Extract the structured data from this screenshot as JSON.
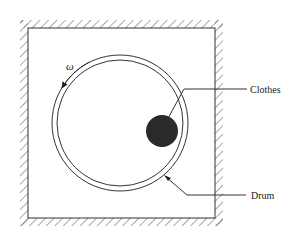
{
  "diagram": {
    "type": "physical-schematic",
    "labels": {
      "omega": "ω",
      "clothes": "Clothes",
      "drum": "Drum"
    },
    "colors": {
      "line": "#333333",
      "clothes_fill": "#2a2a2a",
      "background": "#ffffff"
    },
    "elements": [
      {
        "id": "housing",
        "kind": "fixed-wall-box",
        "hatched": true
      },
      {
        "id": "drum",
        "kind": "double-circle"
      },
      {
        "id": "clothes",
        "kind": "filled-circle",
        "label": "Clothes"
      },
      {
        "id": "rotation",
        "kind": "curved-arrow",
        "label": "ω",
        "direction": "counter-clockwise"
      }
    ]
  }
}
